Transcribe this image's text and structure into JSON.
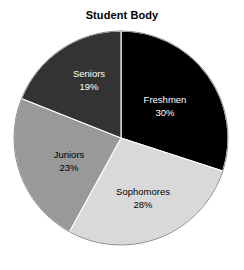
{
  "chart_data": {
    "type": "pie",
    "title": "Student Body",
    "xlabel": "",
    "ylabel": "",
    "legend": "none",
    "grid": false,
    "start_angle_deg": 0,
    "direction": "clockwise",
    "categories": [
      "Freshmen",
      "Sophomores",
      "Juniors",
      "Seniors"
    ],
    "values": [
      30,
      28,
      23,
      19
    ],
    "value_suffix": "%",
    "labels": [
      "30%",
      "28%",
      "23%",
      "19%"
    ],
    "colors": [
      "#000000",
      "#d9d9d9",
      "#999999",
      "#333333"
    ],
    "label_colors": [
      "#ffffff",
      "#000000",
      "#000000",
      "#ffffff"
    ],
    "slices": [
      {
        "name": "Freshmen",
        "value": 30,
        "label": "30%",
        "color": "#000000",
        "label_color": "#ffffff",
        "start_deg": 0,
        "end_deg": 108,
        "label_x": 165,
        "label_y": 100
      },
      {
        "name": "Sophomores",
        "value": 28,
        "label": "28%",
        "color": "#d9d9d9",
        "label_color": "#000000",
        "start_deg": 108,
        "end_deg": 208.8,
        "label_x": 143,
        "label_y": 192
      },
      {
        "name": "Juniors",
        "value": 23,
        "label": "23%",
        "color": "#999999",
        "label_color": "#000000",
        "start_deg": 208.8,
        "end_deg": 291.6,
        "label_x": 69,
        "label_y": 155
      },
      {
        "name": "Seniors",
        "value": 19,
        "label": "19%",
        "color": "#333333",
        "label_color": "#ffffff",
        "start_deg": 291.6,
        "end_deg": 360,
        "label_x": 89,
        "label_y": 74
      }
    ],
    "geometry": {
      "center_x": 121,
      "center_y": 138,
      "radius": 107
    },
    "background": "#ffffff"
  }
}
